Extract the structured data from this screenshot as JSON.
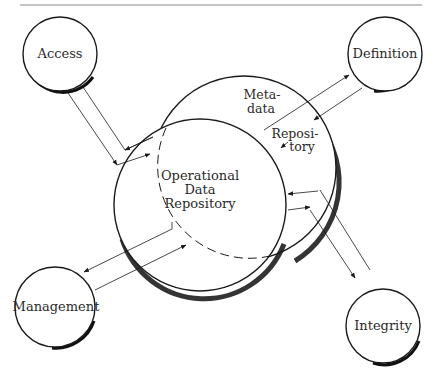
{
  "diagram": {
    "title_rule": true,
    "center": {
      "label_lines": [
        "Operational",
        "Data",
        "Repository"
      ]
    },
    "metadata": {
      "label_lines_top": [
        "Meta-",
        "data"
      ],
      "label_lines_bottom": [
        "Reposi-",
        "tory"
      ]
    },
    "nodes": [
      {
        "id": "access",
        "label": "Access"
      },
      {
        "id": "definition",
        "label": "Definition"
      },
      {
        "id": "management",
        "label": "Management"
      },
      {
        "id": "integrity",
        "label": "Integrity"
      }
    ],
    "colors": {
      "stroke": "#1a1a1a",
      "rule": "#8a8a8a",
      "background": "#ffffff"
    }
  }
}
